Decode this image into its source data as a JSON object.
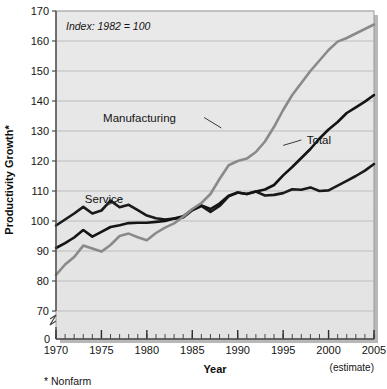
{
  "chart_data": {
    "type": "line",
    "title": "",
    "annotation": "Index: 1982 = 100",
    "xlabel": "Year",
    "ylabel": "Productivity Growth*",
    "footnote": "* Nonfarm",
    "estimate_note": "(estimate)",
    "grid": true,
    "legend_position": "inline-labels",
    "xlim": [
      1970,
      2005
    ],
    "ylim": [
      70,
      170
    ],
    "y_axis_break": true,
    "y_break_value": "0",
    "xticks": [
      1970,
      1975,
      1980,
      1985,
      1990,
      1995,
      2000,
      2005
    ],
    "xtick_labels": [
      "1970",
      "1975",
      "1980",
      "1985",
      "1990",
      "1995",
      "2000",
      "2005"
    ],
    "yticks": [
      70,
      80,
      90,
      100,
      110,
      120,
      130,
      140,
      150,
      160,
      170
    ],
    "ytick_labels": [
      "70",
      "80",
      "90",
      "100",
      "110",
      "120",
      "130",
      "140",
      "150",
      "160",
      "170"
    ],
    "y_zero_label": "0",
    "x": [
      1970,
      1971,
      1972,
      1973,
      1974,
      1975,
      1976,
      1977,
      1978,
      1979,
      1980,
      1981,
      1982,
      1983,
      1984,
      1985,
      1986,
      1987,
      1988,
      1989,
      1990,
      1991,
      1992,
      1993,
      1994,
      1995,
      1996,
      1997,
      1998,
      1999,
      2000,
      2001,
      2002,
      2003,
      2004,
      2005
    ],
    "series": [
      {
        "name": "Service",
        "color": "#1a1a1a",
        "width": 2.6,
        "label_x": 1977.4,
        "label_y": 107.5,
        "values": [
          98.5,
          100.5,
          102.5,
          104.7,
          102.5,
          103.5,
          106.8,
          104.6,
          105.4,
          103.6,
          101.8,
          100.9,
          100.5,
          100.8,
          101.2,
          103.6,
          105.0,
          103.0,
          105.0,
          108.2,
          109.5,
          109.0,
          109.8,
          108.5,
          108.7,
          109.3,
          110.6,
          110.4,
          111.2,
          110.0,
          110.2,
          111.8,
          113.4,
          115.0,
          116.8,
          119.0
        ]
      },
      {
        "name": "Total",
        "color": "#141414",
        "width": 2.6,
        "label_x": 1997.6,
        "label_y": 127.0,
        "values": [
          91.0,
          92.6,
          94.5,
          97.0,
          94.8,
          96.4,
          98.0,
          98.6,
          99.3,
          99.4,
          99.4,
          99.7,
          100.0,
          100.8,
          101.6,
          103.8,
          105.2,
          104.0,
          105.8,
          108.4,
          109.5,
          109.0,
          109.8,
          110.5,
          112.0,
          115.2,
          118.0,
          121.0,
          124.0,
          127.5,
          130.5,
          133.0,
          136.0,
          137.9,
          139.8,
          142.0
        ]
      },
      {
        "name": "Manufacturing",
        "color": "#8a8a8a",
        "width": 2.6,
        "label_x": 1983.2,
        "label_y": 134.5,
        "values": [
          82.0,
          85.5,
          88.0,
          91.8,
          90.8,
          89.8,
          92.0,
          95.0,
          95.8,
          94.6,
          93.6,
          96.0,
          97.8,
          99.2,
          101.4,
          104.0,
          106.0,
          109.0,
          114.0,
          118.6,
          120.0,
          120.8,
          123.0,
          126.5,
          131.4,
          137.0,
          142.0,
          146.0,
          150.0,
          153.5,
          157.0,
          159.8,
          161.0,
          162.5,
          164.0,
          165.5
        ]
      }
    ],
    "leader_lines": [
      {
        "name": "manufacturing-leader",
        "x1": 1986.3,
        "y1": 134.5,
        "x2": 1988.2,
        "y2": 131.0
      },
      {
        "name": "total-leader",
        "x1": 1997.0,
        "y1": 127.0,
        "x2": 1995.0,
        "y2": 125.2
      },
      {
        "name": "service-leader",
        "x1": 1977.2,
        "y1": 107.4,
        "x2": 1975.6,
        "y2": 105.2
      }
    ]
  }
}
